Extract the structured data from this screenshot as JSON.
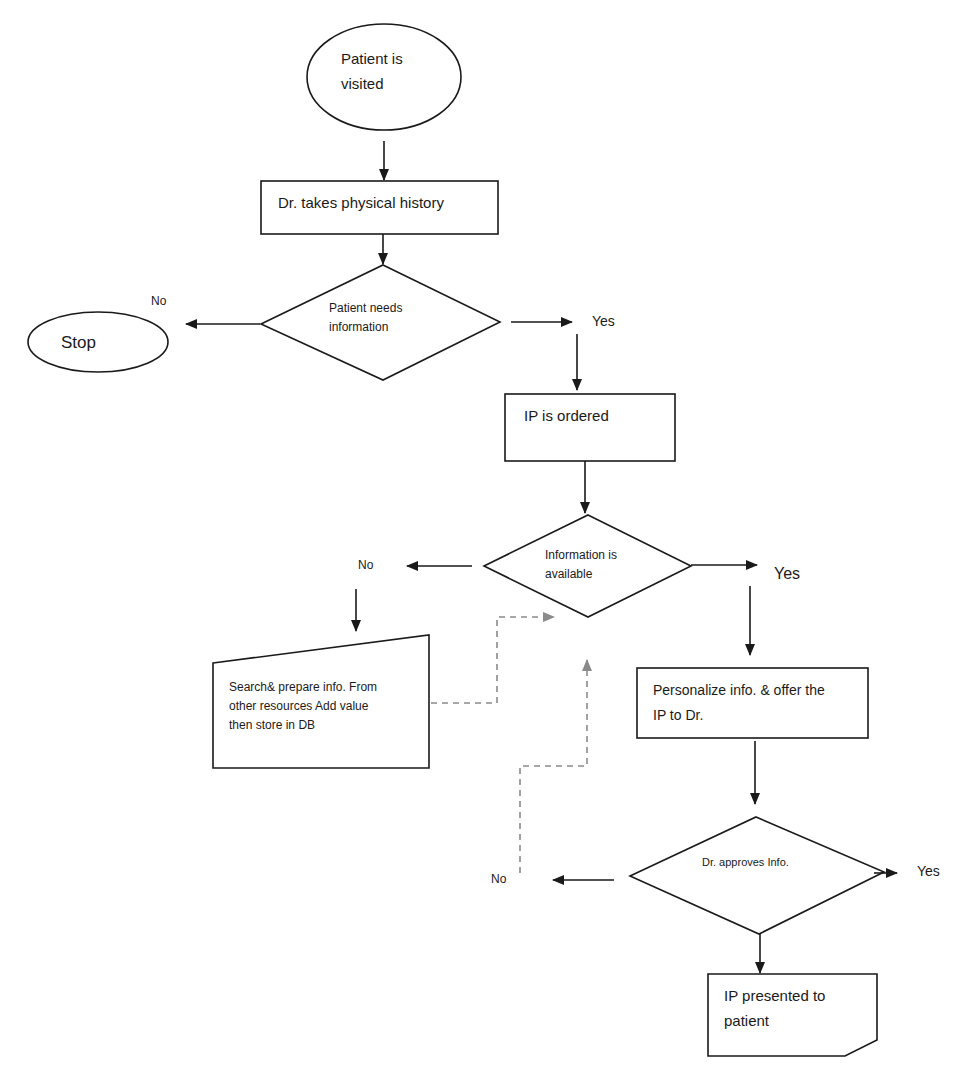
{
  "diagram": {
    "type": "flowchart",
    "colors": {
      "stroke": "#1a1a1a",
      "dashed_connector": "#8a8a8a",
      "background": "#ffffff"
    },
    "nodes": {
      "start": {
        "shape": "ellipse",
        "lines": [
          "Patient is",
          "visited"
        ]
      },
      "history": {
        "shape": "rectangle",
        "lines": [
          "Dr. takes physical history"
        ]
      },
      "needs_info": {
        "shape": "diamond",
        "lines": [
          "Patient needs",
          "information"
        ]
      },
      "stop": {
        "shape": "ellipse",
        "lines": [
          "Stop"
        ]
      },
      "ip_ordered": {
        "shape": "rectangle",
        "lines": [
          "IP is ordered"
        ]
      },
      "info_available": {
        "shape": "diamond",
        "lines": [
          "Information is",
          "available"
        ]
      },
      "search": {
        "shape": "manual-input",
        "lines": [
          "Search& prepare info. From",
          "other resources Add value",
          "then  store in DB"
        ]
      },
      "personalize": {
        "shape": "rectangle",
        "lines": [
          "Personalize info. & offer the",
          "IP to Dr."
        ]
      },
      "approves": {
        "shape": "diamond",
        "lines": [
          "Dr. approves Info."
        ]
      },
      "presented": {
        "shape": "card",
        "lines": [
          "IP presented to",
          "patient"
        ]
      }
    },
    "edge_labels": {
      "needs_no": "No",
      "needs_yes": "Yes",
      "available_no": "No",
      "available_yes": "Yes",
      "approves_no": "No",
      "approves_yes": "Yes"
    },
    "edges": [
      {
        "from": "start",
        "to": "history"
      },
      {
        "from": "history",
        "to": "needs_info"
      },
      {
        "from": "needs_info",
        "to": "stop",
        "label": "No"
      },
      {
        "from": "needs_info",
        "to": "ip_ordered",
        "label": "Yes"
      },
      {
        "from": "ip_ordered",
        "to": "info_available"
      },
      {
        "from": "info_available",
        "to": "search",
        "label": "No"
      },
      {
        "from": "info_available",
        "to": "personalize",
        "label": "Yes"
      },
      {
        "from": "search",
        "to": "info_available",
        "style": "dashed"
      },
      {
        "from": "personalize",
        "to": "approves"
      },
      {
        "from": "approves",
        "to": "info_available",
        "label": "No",
        "style": "dashed"
      },
      {
        "from": "approves",
        "to": "presented"
      },
      {
        "from": "approves",
        "to": "end",
        "label": "Yes"
      }
    ]
  }
}
